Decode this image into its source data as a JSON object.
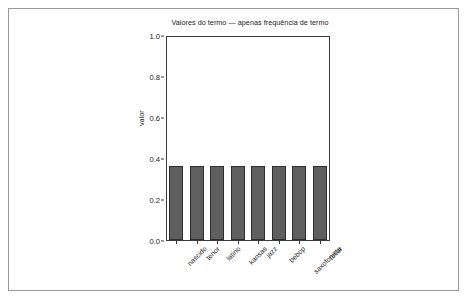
{
  "chart_data": {
    "type": "bar",
    "title": "Valores do termo — apenas frequência de termo",
    "xlabel": "",
    "ylabel": "valor",
    "categories": [
      "nascido",
      "tenor",
      "latino",
      "kansas",
      "jazz",
      "bebop",
      "saxofonista",
      "tocar"
    ],
    "values": [
      0.36,
      0.36,
      0.36,
      0.36,
      0.36,
      0.36,
      0.36,
      0.36
    ],
    "ylim": [
      0.0,
      1.0
    ],
    "yticks": [
      "0.0",
      "0.2",
      "0.4",
      "0.6",
      "0.8",
      "1.0"
    ],
    "ytick_values": [
      0.0,
      0.2,
      0.4,
      0.6,
      0.8,
      1.0
    ],
    "grid": false,
    "legend": false,
    "bar_color": "#5f5f5f",
    "bar_edge_color": "#2e2e2e",
    "axis_color": "#3a3a3a",
    "text_color": "#222222",
    "background_color": "#ffffff",
    "frame_color": "#9a9a9a"
  }
}
